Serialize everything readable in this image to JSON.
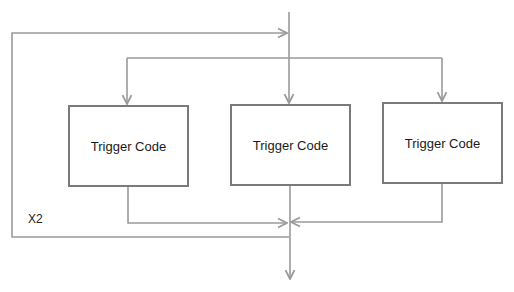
{
  "diagram": {
    "type": "flowchart",
    "colors": {
      "line": "#9a9a9a",
      "box_border": "#7a7a7a",
      "text": "#1a1a1a",
      "background": "#ffffff"
    },
    "nodes": [
      {
        "id": "trigger-1",
        "label": "Trigger Code"
      },
      {
        "id": "trigger-2",
        "label": "Trigger Code"
      },
      {
        "id": "trigger-3",
        "label": "Trigger Code"
      }
    ],
    "loop_label": "X2",
    "edges": [
      {
        "from": "input",
        "to": "trigger-1"
      },
      {
        "from": "input",
        "to": "trigger-2"
      },
      {
        "from": "input",
        "to": "trigger-3"
      },
      {
        "from": "trigger-1",
        "to": "merge"
      },
      {
        "from": "trigger-2",
        "to": "merge"
      },
      {
        "from": "trigger-3",
        "to": "merge"
      },
      {
        "from": "merge",
        "to": "output"
      },
      {
        "from": "merge",
        "to": "input",
        "label": "X2"
      }
    ]
  }
}
